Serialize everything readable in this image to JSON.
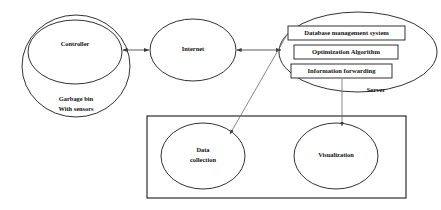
{
  "diagram": {
    "background_color": "#ffffff",
    "stroke_color": "#1b1b1b",
    "connector_color": "#4a4a4a",
    "nodes": {
      "garbage_bin": {
        "label_line1": "Garbage bin",
        "label_line2": "With sensors",
        "shape": "ellipse"
      },
      "controller": {
        "label": "Controller",
        "shape": "ellipse"
      },
      "internet": {
        "label": "Internet",
        "shape": "ellipse"
      },
      "server": {
        "label": "Server",
        "shape": "ellipse",
        "boxes": [
          {
            "label": "Database management system"
          },
          {
            "label": "Optimization Algorithm"
          },
          {
            "label": "Information forwarding"
          }
        ]
      },
      "data_collection": {
        "label_line1": "Data",
        "label_line2": "collection",
        "shape": "ellipse"
      },
      "visualization": {
        "label": "Visualization",
        "shape": "ellipse"
      },
      "application_container": {
        "label": "",
        "shape": "rectangle"
      }
    },
    "connectors": [
      {
        "name": "controller-to-internet",
        "type": "bidirectional"
      },
      {
        "name": "internet-to-server",
        "type": "bidirectional"
      },
      {
        "name": "database-to-data-collection",
        "type": "directed"
      },
      {
        "name": "information-forwarding-to-visualization",
        "type": "directed"
      }
    ]
  }
}
